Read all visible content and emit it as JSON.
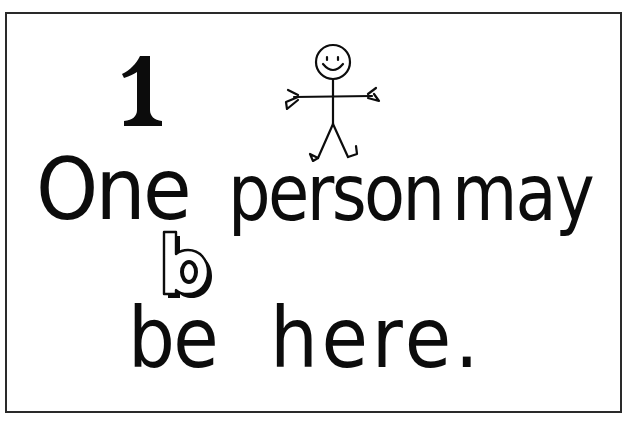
{
  "worksheet": {
    "numeral": "1",
    "illustration": "stick-figure-person-smiling-arms-outstretched",
    "focus_letter": "b",
    "sentence": {
      "line1": {
        "word1": "One",
        "word2": "person",
        "word3": "may"
      },
      "line2": {
        "word1": "be",
        "word2": "here."
      }
    }
  },
  "colors": {
    "ink": "#0c0c0c",
    "paper": "#ffffff",
    "frame": "#2a2a2a"
  }
}
